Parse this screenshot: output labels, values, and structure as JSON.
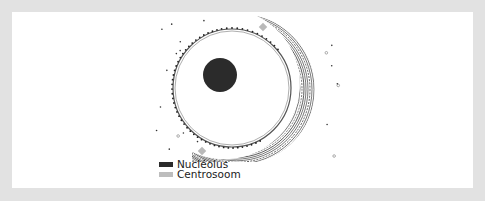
{
  "figure": {
    "type": "cell-nucleus-diagram",
    "colors": {
      "frame": "#e2e2e2",
      "panel": "#ffffff",
      "nucleolus": "#2b2b2b",
      "centrosome": "#b9b9b9",
      "membrane": "#555555",
      "hatch": "#444444"
    },
    "nucleus": {
      "cx": 220,
      "cy": 76,
      "r": 59
    },
    "nucleolus": {
      "cx": 208,
      "cy": 63,
      "r": 17
    },
    "centrosomes": [
      {
        "x": 251,
        "y": 15
      },
      {
        "x": 190,
        "y": 139
      }
    ]
  },
  "legend": {
    "items": [
      {
        "label": "Nucleolus",
        "color": "#2b2b2b"
      },
      {
        "label": "Centrosoom",
        "color": "#bdbdbd"
      }
    ]
  }
}
